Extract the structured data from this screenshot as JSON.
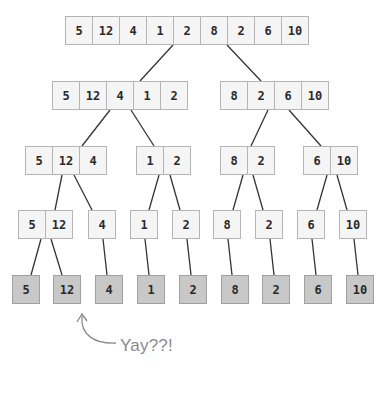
{
  "diagram": {
    "levels": [
      {
        "level": 0,
        "arrays": [
          {
            "x": 65,
            "y": 16,
            "values": [
              "5",
              "12",
              "4",
              "1",
              "2",
              "8",
              "2",
              "6",
              "10"
            ]
          }
        ]
      },
      {
        "level": 1,
        "arrays": [
          {
            "x": 52,
            "y": 81,
            "values": [
              "5",
              "12",
              "4",
              "1",
              "2"
            ]
          },
          {
            "x": 220,
            "y": 81,
            "values": [
              "8",
              "2",
              "6",
              "10"
            ]
          }
        ]
      },
      {
        "level": 2,
        "arrays": [
          {
            "x": 25,
            "y": 146,
            "values": [
              "5",
              "12",
              "4"
            ]
          },
          {
            "x": 136,
            "y": 146,
            "values": [
              "1",
              "2"
            ]
          },
          {
            "x": 220,
            "y": 146,
            "values": [
              "8",
              "2"
            ]
          },
          {
            "x": 303,
            "y": 146,
            "values": [
              "6",
              "10"
            ]
          }
        ]
      },
      {
        "level": 3,
        "arrays": [
          {
            "x": 18,
            "y": 210,
            "values": [
              "5",
              "12"
            ]
          },
          {
            "x": 88,
            "y": 210,
            "values": [
              "4"
            ]
          },
          {
            "x": 130,
            "y": 210,
            "values": [
              "1"
            ]
          },
          {
            "x": 172,
            "y": 210,
            "values": [
              "2"
            ]
          },
          {
            "x": 213,
            "y": 210,
            "values": [
              "8"
            ]
          },
          {
            "x": 255,
            "y": 210,
            "values": [
              "2"
            ]
          },
          {
            "x": 297,
            "y": 210,
            "values": [
              "6"
            ]
          },
          {
            "x": 339,
            "y": 210,
            "values": [
              "10"
            ]
          }
        ]
      },
      {
        "level": 4,
        "leaf": true,
        "arrays": [
          {
            "x": 12,
            "y": 275,
            "values": [
              "5"
            ]
          },
          {
            "x": 53,
            "y": 275,
            "values": [
              "12"
            ]
          },
          {
            "x": 95,
            "y": 275,
            "values": [
              "4"
            ]
          },
          {
            "x": 137,
            "y": 275,
            "values": [
              "1"
            ]
          },
          {
            "x": 179,
            "y": 275,
            "values": [
              "2"
            ]
          },
          {
            "x": 221,
            "y": 275,
            "values": [
              "8"
            ]
          },
          {
            "x": 262,
            "y": 275,
            "values": [
              "2"
            ]
          },
          {
            "x": 304,
            "y": 275,
            "values": [
              "6"
            ]
          },
          {
            "x": 346,
            "y": 275,
            "values": [
              "10"
            ]
          }
        ]
      }
    ],
    "annotation": {
      "text": "Yay??!",
      "arrow": "curved-up-arrow"
    },
    "colors": {
      "cell_fill": "#f5f5f5",
      "leaf_fill": "#c8c8c8",
      "border": "#b5b5b5",
      "line": "#333333",
      "note": "#8a8a8a"
    }
  }
}
